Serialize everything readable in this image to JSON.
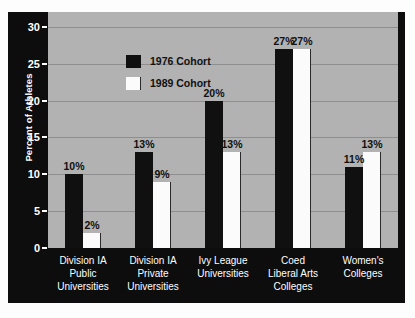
{
  "chart_data": {
    "type": "bar",
    "title": "",
    "xlabel": "",
    "ylabel": "Percent of Athletes",
    "ylim": [
      0,
      32
    ],
    "yticks": [
      0,
      5,
      10,
      15,
      20,
      25,
      30
    ],
    "ytick_labels": [
      "0",
      "5",
      "10",
      "15",
      "20",
      "25",
      "30"
    ],
    "grid": true,
    "legend_position": "upper left",
    "categories": [
      "Division IA\nPublic\nUniversities",
      "Division IA\nPrivate\nUniversities",
      "Ivy League\nUniversities",
      "Coed\nLiberal Arts\nColleges",
      "Women's\nColleges"
    ],
    "series": [
      {
        "name": "1976 Cohort",
        "color": "#101010",
        "values": [
          10,
          13,
          20,
          27,
          11
        ],
        "labels": [
          "10%",
          "13%",
          "20%",
          "27%",
          "11%"
        ]
      },
      {
        "name": "1989 Cohort",
        "color": "#fbfbfb",
        "values": [
          2,
          9,
          13,
          27,
          13
        ],
        "labels": [
          "2%",
          "9%",
          "13%",
          "27%",
          "13%"
        ]
      }
    ]
  },
  "colors": {
    "plot_background": "#b2b2b2",
    "panel_background": "#0d0d0d",
    "gridline": "#8e8e8e",
    "axis_text": "#ffffff",
    "value_text": "#101010"
  }
}
